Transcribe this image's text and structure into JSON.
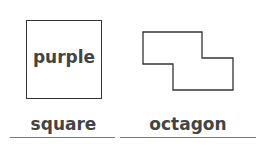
{
  "figures": [
    {
      "shape": "square",
      "inner_text": "purple",
      "answer": "square"
    },
    {
      "shape": "octagon",
      "inner_text": "",
      "answer": "octagon"
    }
  ],
  "colors": {
    "stroke": "#333333",
    "text": "#444444",
    "line": "#777777"
  }
}
